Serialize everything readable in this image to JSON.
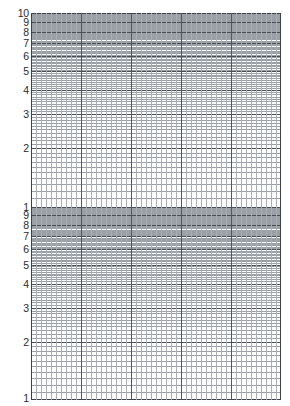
{
  "page": {
    "paper_color": "#ffffff",
    "minor_line_color": "#9aa0a6",
    "major_line_color": "#4a4f55",
    "label_color": "#2b2b2b",
    "width_px": 290,
    "height_px": 406
  },
  "chart_data": {
    "type": "line",
    "title": "",
    "xlabel": "",
    "ylabel": "",
    "grid": "log-linear",
    "series": [],
    "x": [],
    "values": [],
    "legend_position": "none",
    "x_axis": {
      "scale": "linear",
      "major_divisions": 5,
      "minor_per_major": 10,
      "total_minor_cells": 50,
      "tick_labels": []
    },
    "y_axis": {
      "scale": "log",
      "cycles": 2,
      "range_top": 10,
      "range_bottom": 1,
      "tick_labels": [
        "10",
        "9",
        "8",
        "7",
        "6",
        "5",
        "4",
        "3",
        "2",
        "1",
        "9",
        "8",
        "7",
        "6",
        "5",
        "4",
        "3",
        "2",
        "1"
      ],
      "decade_1_labels": [
        "10",
        "9",
        "8",
        "7",
        "6",
        "5",
        "4",
        "3",
        "2"
      ],
      "decade_2_labels": [
        "1",
        "9",
        "8",
        "7",
        "6",
        "5",
        "4",
        "3",
        "2",
        "1"
      ],
      "minor_subdivisions_per_decade": [
        1,
        2,
        3,
        4,
        5,
        6,
        7,
        8,
        9,
        10
      ]
    },
    "geometry": {
      "grid_left_px": 31,
      "grid_top_px": 13,
      "grid_width_px": 250,
      "grid_height_px": 387,
      "decade_height_px": 193.5
    }
  }
}
